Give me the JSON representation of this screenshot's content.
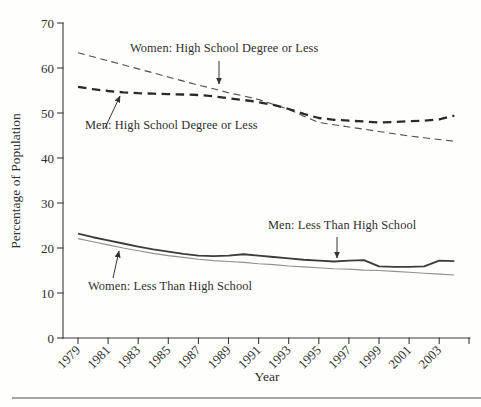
{
  "figure": {
    "background": "#fefefd",
    "text_color": "#2e2e2e"
  },
  "chart_data": {
    "type": "line",
    "title": "",
    "xlabel": "Year",
    "ylabel": "Percentage of Population",
    "ylim": [
      0,
      70
    ],
    "x_range": [
      1979,
      2004
    ],
    "grid": false,
    "legend_position": "none",
    "yticks": [
      0,
      10,
      20,
      30,
      40,
      50,
      60,
      70
    ],
    "xtick_years": [
      1979,
      1981,
      1983,
      1985,
      1987,
      1989,
      1991,
      1993,
      1995,
      1997,
      1999,
      2001,
      2003
    ],
    "xtick_labels": [
      "1979",
      "1981",
      "1983",
      "1985",
      "1987",
      "1989",
      "1991",
      "1993",
      "1995",
      "1997",
      "1999",
      "2001",
      "2003"
    ],
    "x": [
      1979,
      1980,
      1981,
      1982,
      1983,
      1984,
      1985,
      1986,
      1987,
      1988,
      1989,
      1990,
      1991,
      1992,
      1993,
      1994,
      1995,
      1996,
      1997,
      1998,
      1999,
      2000,
      2001,
      2002,
      2003,
      2004
    ],
    "series": [
      {
        "id": "women-hs-or-less",
        "name": "Women: High School Degree or Less",
        "style": "dashed-thin",
        "color": "#4f4f4f",
        "values": [
          63.4,
          62.5,
          61.6,
          60.7,
          59.8,
          58.9,
          58.0,
          57.1,
          56.2,
          55.4,
          54.5,
          53.8,
          53.0,
          51.9,
          50.8,
          49.3,
          47.9,
          47.4,
          46.9,
          46.4,
          45.9,
          45.4,
          44.9,
          44.5,
          44.1,
          43.7
        ]
      },
      {
        "id": "men-hs-or-less",
        "name": "Men: High School Degree or Less",
        "style": "dashed-thick",
        "color": "#2a2a2a",
        "values": [
          55.8,
          55.3,
          54.9,
          54.6,
          54.4,
          54.3,
          54.2,
          54.1,
          54.0,
          53.7,
          53.3,
          52.9,
          52.4,
          51.8,
          50.9,
          49.8,
          48.9,
          48.5,
          48.3,
          48.1,
          47.9,
          48.0,
          48.2,
          48.3,
          48.6,
          49.4
        ]
      },
      {
        "id": "men-less-than-hs",
        "name": "Men: Less Than High School",
        "style": "solid-thick",
        "color": "#3c3c3c",
        "values": [
          23.2,
          22.4,
          21.7,
          21.0,
          20.3,
          19.7,
          19.2,
          18.7,
          18.3,
          18.2,
          18.3,
          18.6,
          18.3,
          18.0,
          17.7,
          17.4,
          17.2,
          17.0,
          17.2,
          17.3,
          15.9,
          15.8,
          15.8,
          15.9,
          17.2,
          17.1
        ]
      },
      {
        "id": "women-less-than-hs",
        "name": "Women: Less Than High School",
        "style": "solid-thin",
        "color": "#909090",
        "values": [
          22.1,
          21.4,
          20.7,
          20.0,
          19.4,
          18.8,
          18.3,
          17.9,
          17.5,
          17.2,
          17.0,
          16.8,
          16.5,
          16.3,
          16.0,
          15.8,
          15.6,
          15.4,
          15.3,
          15.1,
          15.0,
          14.8,
          14.6,
          14.4,
          14.2,
          14.0
        ]
      }
    ],
    "annotations": [
      {
        "id": "women-hs-annotation",
        "text": "Women: High School Degree or Less",
        "x": 130,
        "y": 41,
        "arrow": {
          "x1": 219,
          "y1": 61,
          "x2": 219,
          "y2": 84
        }
      },
      {
        "id": "men-hs-annotation",
        "text": "Men: High School Degree or Less",
        "x": 85,
        "y": 118,
        "arrow": {
          "x1": 105,
          "y1": 128,
          "x2": 120,
          "y2": 96
        }
      },
      {
        "id": "men-lths-annotation",
        "text": "Men: Less Than High School",
        "x": 268,
        "y": 218,
        "arrow": {
          "x1": 337,
          "y1": 237,
          "x2": 337,
          "y2": 258
        }
      },
      {
        "id": "women-lths-annotation",
        "text": "Women: Less Than High School",
        "x": 88,
        "y": 279,
        "arrow": {
          "x1": 113,
          "y1": 278,
          "x2": 119,
          "y2": 251
        }
      }
    ]
  }
}
